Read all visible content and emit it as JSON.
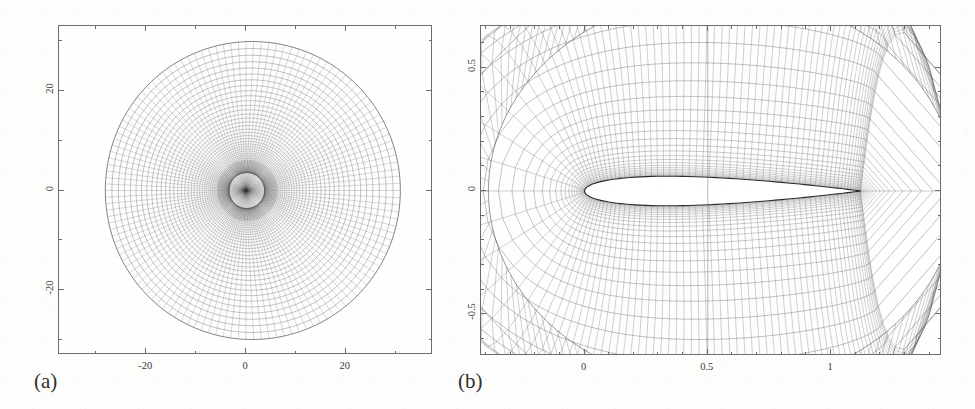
{
  "figure": {
    "width": 975,
    "height": 409,
    "background_color": "#fdfdfb",
    "line_color": "#555555",
    "frame_color": "#6b6b6b",
    "text_color": "#3a3a3a"
  },
  "panels": [
    {
      "id": "a",
      "label": "(a)",
      "label_x": 34,
      "label_y": 369,
      "frame": {
        "x": 58,
        "y": 25,
        "width": 374,
        "height": 329
      },
      "description": "far-field computational O-grid mesh",
      "xaxis": {
        "label": "",
        "range": [
          -37.5,
          37.5
        ],
        "ticks": [
          -20,
          0,
          20
        ],
        "tick_labels": [
          "-20",
          "0",
          "20"
        ],
        "minor_step": 10
      },
      "yaxis": {
        "label": "",
        "range": [
          -33,
          33
        ],
        "ticks": [
          -20,
          0,
          20
        ],
        "tick_labels": [
          "-20",
          "0",
          "20"
        ],
        "minor_step": 10,
        "rotated": true
      },
      "mesh": {
        "type": "o-grid",
        "radial_lines": 128,
        "circumferential_lines": 56,
        "outer_radius_x": 30.5,
        "outer_radius_y": 29.0,
        "inner_radius": 0.12,
        "clustering": "exponential-toward-center",
        "center": [
          0,
          0
        ]
      }
    },
    {
      "id": "b",
      "label": "(b)",
      "label_x": 458,
      "label_y": 369,
      "frame": {
        "x": 480,
        "y": 25,
        "width": 461,
        "height": 330
      },
      "description": "body-fitted mesh detail around symmetric airfoil",
      "xaxis": {
        "label": "",
        "range": [
          -0.42,
          1.45
        ],
        "ticks": [
          0,
          0.5,
          1
        ],
        "tick_labels": [
          "0",
          "0.5",
          "1"
        ],
        "minor_step": 0.1
      },
      "yaxis": {
        "label": "",
        "range": [
          -0.67,
          0.67
        ],
        "ticks": [
          -0.5,
          0,
          0.5
        ],
        "tick_labels": [
          "-0.5",
          "0",
          "0.5"
        ],
        "minor_step": 0.1,
        "rotated": true
      },
      "mesh": {
        "type": "c-grid",
        "radial_lines": 128,
        "circumferential_lines": 30,
        "clustering": "wall-normal-exponential",
        "wake_cut_x": 0.5
      },
      "airfoil": {
        "name": "symmetric-airfoil",
        "chord": 1.0,
        "thickness_ratio": 0.12,
        "leading_edge": [
          0.0,
          0.0
        ],
        "trailing_edge": [
          1.12,
          0.0
        ],
        "fill_color": "#ffffff",
        "outline_color": "#2a2a2a"
      }
    }
  ],
  "chart_data": {
    "type": "line",
    "title": "",
    "subtitle": "",
    "xlabel": "",
    "ylabel": "",
    "legend": [],
    "panels": [
      {
        "name": "(a) far-field grid",
        "xlim": [
          -37.5,
          37.5
        ],
        "ylim": [
          -33,
          33
        ],
        "xticks": [
          -20,
          0,
          20
        ],
        "yticks": [
          -20,
          0,
          20
        ],
        "grid": false,
        "series": [
          {
            "name": "outer boundary",
            "shape": "ellipse",
            "rx": 30.5,
            "ry": 29.0,
            "cx": 0,
            "cy": 0
          },
          {
            "name": "radial grid lines",
            "count": 128
          },
          {
            "name": "circumferential grid lines",
            "count": 56
          }
        ]
      },
      {
        "name": "(b) near-field grid",
        "xlim": [
          -0.42,
          1.45
        ],
        "ylim": [
          -0.67,
          0.67
        ],
        "xticks": [
          0,
          0.5,
          1
        ],
        "yticks": [
          -0.5,
          0,
          0.5
        ],
        "grid": false,
        "series": [
          {
            "name": "airfoil surface",
            "chord": 1.0,
            "thickness": 0.12
          },
          {
            "name": "wall-normal grid lines",
            "count": 128
          },
          {
            "name": "streamwise grid lines",
            "count": 30
          }
        ]
      }
    ]
  }
}
